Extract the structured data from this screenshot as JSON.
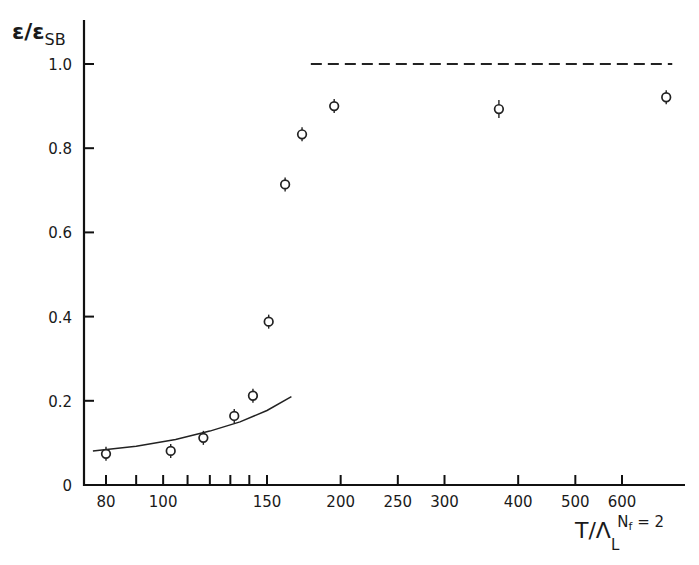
{
  "chart_data": {
    "type": "scatter",
    "title": "",
    "ylabel": "ε/ε_SB",
    "ylabel_main": "ε/ε",
    "ylabel_sub": "SB",
    "xlabel": "T/Λ_L^{Nf=2}",
    "xlabel_main": "T/Λ",
    "xlabel_sub": "L",
    "xlabel_sup": "N",
    "xlabel_sup_sub": "f",
    "xlabel_sup_tail": " = 2",
    "xscale": "log",
    "xlim": [
      75,
      760
    ],
    "ylim": [
      0,
      1.1
    ],
    "grid": false,
    "x_ticks_labeled": [
      80,
      100,
      150,
      200,
      250,
      300,
      400,
      500,
      600
    ],
    "x_ticks_minor": [
      90,
      110,
      120,
      130,
      140
    ],
    "y_ticks": [
      0,
      0.2,
      0.4,
      0.6,
      0.8,
      1.0
    ],
    "y_tick_labels": [
      "0",
      "0.2",
      "0.4",
      "0.6",
      "0.8",
      "1.0"
    ],
    "series": [
      {
        "name": "lattice data",
        "marker": "open-circle-with-errorbar",
        "x": [
          80,
          103,
          117,
          132,
          142,
          151,
          161,
          172,
          195,
          371,
          713
        ],
        "y": [
          0.074,
          0.081,
          0.112,
          0.164,
          0.212,
          0.388,
          0.714,
          0.833,
          0.9,
          0.893,
          0.921
        ]
      },
      {
        "name": "low-temperature curve",
        "style": "solid-line",
        "x": [
          76,
          90,
          105,
          120,
          135,
          150,
          165
        ],
        "y": [
          0.081,
          0.092,
          0.108,
          0.128,
          0.15,
          0.177,
          0.21
        ]
      },
      {
        "name": "Stefan-Boltzmann limit",
        "style": "dashed-line",
        "x": [
          178,
          730
        ],
        "y": [
          1.0,
          1.0
        ]
      }
    ]
  }
}
